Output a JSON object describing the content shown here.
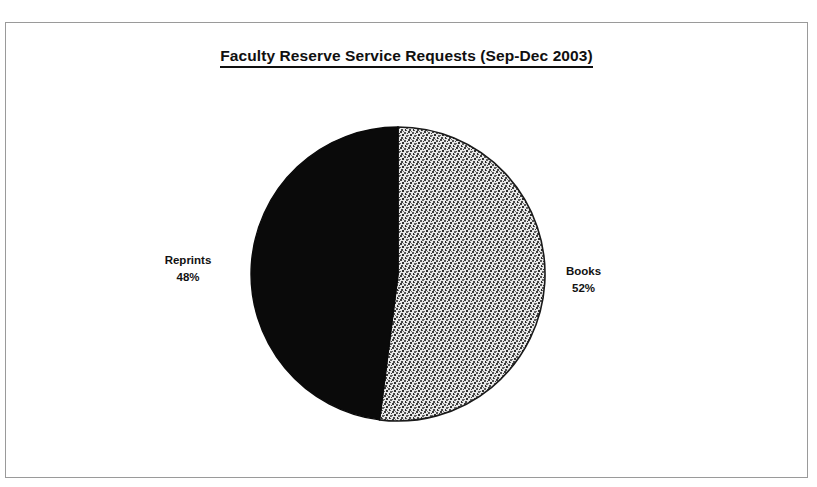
{
  "chart_data": {
    "type": "pie",
    "title": "Faculty Reserve Service Requests (Sep-Dec 2003)",
    "subtitle": "",
    "xlabel": "",
    "ylabel": "",
    "legend_position": "none",
    "grid": false,
    "labels_show_percent": true,
    "start_angle_deg": 0,
    "direction": "clockwise",
    "categories": [
      "Books",
      "Reprints"
    ],
    "values": [
      52,
      48
    ],
    "slices": [
      {
        "name": "Books",
        "label": "Books",
        "percent": 52,
        "percent_text": "52%",
        "fill_style": "gray-stipple",
        "color": "#9c9c9c",
        "label_side": "right"
      },
      {
        "name": "Reprints",
        "label": "Reprints",
        "percent": 48,
        "percent_text": "48%",
        "fill_style": "solid",
        "color": "#0a0a0a",
        "label_side": "left"
      }
    ],
    "annotations": []
  },
  "frame": {
    "border_color": "#9a9a9a",
    "background": "#ffffff"
  },
  "title": {
    "text": "Faculty Reserve Service Requests (Sep-Dec 2003)",
    "underlined": true,
    "bold": true,
    "color": "#101010"
  },
  "labels": {
    "reprints": {
      "name": "Reprints",
      "percent": "48%"
    },
    "books": {
      "name": "Books",
      "percent": "52%"
    }
  }
}
